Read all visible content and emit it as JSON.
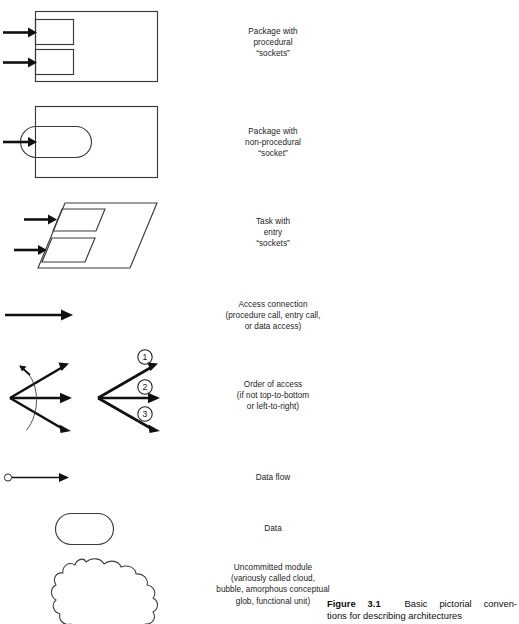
{
  "figure": {
    "number_label": "Figure 3.1",
    "caption_line_1": "Basic pictorial conven-",
    "caption_line_2": "tions for describing architectures"
  },
  "rows": [
    {
      "id": "package-procedural",
      "symbol": "rectangle-with-two-square-sockets",
      "arrows_in": 2,
      "caption": [
        "Package with",
        "procedural",
        "“sockets”"
      ]
    },
    {
      "id": "package-non-procedural",
      "symbol": "rectangle-with-rounded-socket",
      "arrows_in": 1,
      "caption": [
        "Package with",
        "non-procedural",
        "“socket”"
      ]
    },
    {
      "id": "task-entry",
      "symbol": "parallelogram-with-two-sockets",
      "arrows_in": 2,
      "caption": [
        "Task with",
        "entry",
        "“sockets”"
      ]
    },
    {
      "id": "access-connection",
      "symbol": "single-arrow",
      "arrows_in": 0,
      "caption": [
        "Access connection",
        "(procedure call, entry call,",
        "or data access)"
      ]
    },
    {
      "id": "order-of-access",
      "symbol": "two-arrow-fans",
      "arrows_in": 0,
      "caption": [
        "Order of access",
        "(if not top-to-bottom",
        "or left-to-right)"
      ]
    },
    {
      "id": "data-flow",
      "symbol": "circle-tailed-arrow",
      "arrows_in": 0,
      "caption": [
        "Data flow"
      ]
    },
    {
      "id": "data",
      "symbol": "rounded-rectangle",
      "arrows_in": 0,
      "caption": [
        "Data"
      ]
    },
    {
      "id": "uncommitted-module",
      "symbol": "cloud",
      "arrows_in": 0,
      "caption": [
        "Uncommitted module",
        "(variously called cloud,",
        "bubble, amorphous conceptual",
        "glob, functional unit)"
      ]
    }
  ],
  "order_of_access": {
    "markers": [
      "1",
      "2",
      "3"
    ]
  },
  "colors": {
    "ink": "#1a1a1a",
    "line": "#2b2b2b",
    "arrow": "#101010",
    "page": "#ffffff"
  }
}
